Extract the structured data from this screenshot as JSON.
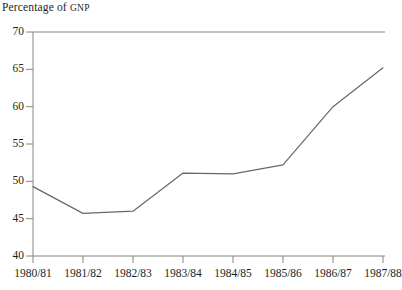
{
  "chart_data": {
    "type": "line",
    "title": "Percentage of GNP",
    "title_lead": "Percentage of ",
    "title_smallcaps": "GNP",
    "xlabel": "",
    "ylabel": "",
    "categories": [
      "1980/81",
      "1981/82",
      "1982/83",
      "1983/84",
      "1984/85",
      "1985/86",
      "1986/87",
      "1987/88"
    ],
    "values": [
      49.3,
      45.7,
      46.0,
      51.1,
      51.0,
      52.2,
      60.0,
      65.2
    ],
    "series": [
      {
        "name": "Percentage of GNP",
        "values": [
          49.3,
          45.7,
          46.0,
          51.1,
          51.0,
          52.2,
          60.0,
          65.2
        ]
      }
    ],
    "ylim": [
      40,
      70
    ],
    "yticks": [
      40,
      45,
      50,
      55,
      60,
      65,
      70
    ],
    "ytick_labels": [
      "40",
      "45",
      "50",
      "55",
      "60",
      "65",
      "70"
    ],
    "grid": false,
    "legend": "none",
    "line_color": "#6b6762",
    "axis_color": "#8a8580"
  },
  "source_note": ""
}
